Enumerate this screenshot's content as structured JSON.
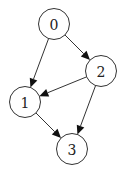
{
  "graph": {
    "directed": true,
    "nodes": [
      {
        "id": "0",
        "label": "0"
      },
      {
        "id": "1",
        "label": "1"
      },
      {
        "id": "2",
        "label": "2"
      },
      {
        "id": "3",
        "label": "3"
      }
    ],
    "edges": [
      {
        "from": "0",
        "to": "1"
      },
      {
        "from": "0",
        "to": "2"
      },
      {
        "from": "2",
        "to": "1"
      },
      {
        "from": "1",
        "to": "3"
      },
      {
        "from": "2",
        "to": "3"
      }
    ]
  },
  "colors": {
    "node_fill": "#ffffff",
    "node_stroke": "#333333",
    "edge": "#333333",
    "label": "#222222"
  }
}
